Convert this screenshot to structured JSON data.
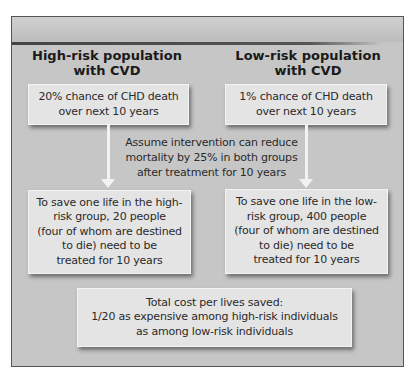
{
  "headings": {
    "left": [
      "High-risk population",
      "with CVD"
    ],
    "right": [
      "Low-risk population",
      "with CVD"
    ]
  },
  "top_boxes": {
    "left": [
      "20% chance of CHD death",
      "over next 10 years"
    ],
    "right": [
      "1% chance of CHD death",
      "over next 10 years"
    ]
  },
  "assumption": [
    "Assume intervention can reduce",
    "mortality by 25% in both groups",
    "after treatment for 10 years"
  ],
  "bottom_boxes": {
    "left": [
      "To save one life in the high-",
      "risk group, 20 people",
      "(four of whom are destined",
      "to die) need to be",
      "treated for 10 years"
    ],
    "right": [
      "To save one life in the low-",
      "risk group, 400 people",
      "(four of whom are destined",
      "to die) need to be",
      "treated for 10 years"
    ]
  },
  "summary": [
    "Total cost per lives saved:",
    "1/20 as expensive among high-risk individuals",
    "as among low-risk individuals"
  ],
  "colors": {
    "frame_bg": "#c6c6c6",
    "box_bg": "#e4e4e4",
    "bar": "#444444",
    "arrow": "#f2f2f2"
  }
}
